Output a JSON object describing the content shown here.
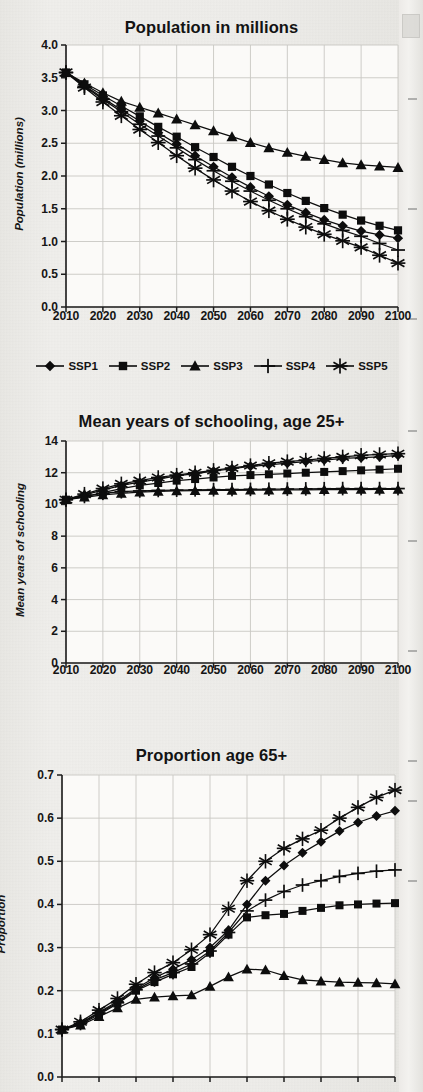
{
  "page": {
    "background": "#eeedea",
    "ink": "#111111"
  },
  "series_names": [
    "SSP1",
    "SSP2",
    "SSP3",
    "SSP4",
    "SSP5"
  ],
  "markers": {
    "SSP1": "diamond-marker",
    "SSP2": "square-marker",
    "SSP3": "triangle-marker",
    "SSP4": "plus-marker",
    "SSP5": "asterisk-marker"
  },
  "legend": {
    "position": "below-chart-1",
    "entries": [
      {
        "label": "SSP1",
        "marker": "diamond-marker"
      },
      {
        "label": "SSP2",
        "marker": "square-marker"
      },
      {
        "label": "SSP3",
        "marker": "triangle-marker"
      },
      {
        "label": "SSP4",
        "marker": "plus-marker"
      },
      {
        "label": "SSP5",
        "marker": "asterisk-marker"
      }
    ]
  },
  "chart_data": [
    {
      "type": "line",
      "title": "Population in millions",
      "xlabel": "",
      "ylabel": "Population (millions)",
      "x": [
        2010,
        2015,
        2020,
        2025,
        2030,
        2035,
        2040,
        2045,
        2050,
        2055,
        2060,
        2065,
        2070,
        2075,
        2080,
        2085,
        2090,
        2095,
        2100
      ],
      "tick_labels_x": [
        "2010",
        "2020",
        "2030",
        "2040",
        "2050",
        "2060",
        "2070",
        "2080",
        "2090",
        "2100"
      ],
      "tick_labels_y": [
        "0.0",
        "0.5",
        "1.0",
        "1.5",
        "2.0",
        "2.5",
        "3.0",
        "3.5",
        "4.0"
      ],
      "ylim": [
        0.0,
        4.0
      ],
      "xlim": [
        2010,
        2100
      ],
      "grid": true,
      "legend_position": "below",
      "series": [
        {
          "name": "SSP1",
          "marker": "diamond-marker",
          "values": [
            3.58,
            3.38,
            3.19,
            3.01,
            2.84,
            2.66,
            2.49,
            2.31,
            2.14,
            1.98,
            1.83,
            1.69,
            1.56,
            1.44,
            1.33,
            1.24,
            1.16,
            1.1,
            1.05
          ]
        },
        {
          "name": "SSP2",
          "marker": "square-marker",
          "values": [
            3.58,
            3.4,
            3.23,
            3.07,
            2.91,
            2.75,
            2.6,
            2.44,
            2.29,
            2.14,
            2.0,
            1.87,
            1.74,
            1.62,
            1.51,
            1.41,
            1.32,
            1.24,
            1.17
          ]
        },
        {
          "name": "SSP3",
          "marker": "triangle-marker",
          "values": [
            3.58,
            3.42,
            3.27,
            3.14,
            3.05,
            2.96,
            2.87,
            2.78,
            2.69,
            2.6,
            2.51,
            2.43,
            2.36,
            2.3,
            2.25,
            2.2,
            2.17,
            2.15,
            2.13
          ]
        },
        {
          "name": "SSP4",
          "marker": "plus-marker",
          "values": [
            3.58,
            3.37,
            3.17,
            2.98,
            2.79,
            2.61,
            2.43,
            2.25,
            2.08,
            1.92,
            1.77,
            1.63,
            1.5,
            1.38,
            1.27,
            1.17,
            1.08,
            0.97,
            0.87
          ]
        },
        {
          "name": "SSP5",
          "marker": "asterisk-marker",
          "values": [
            3.58,
            3.35,
            3.13,
            2.92,
            2.71,
            2.51,
            2.31,
            2.12,
            1.94,
            1.77,
            1.61,
            1.47,
            1.34,
            1.22,
            1.11,
            1.01,
            0.91,
            0.79,
            0.67
          ]
        }
      ]
    },
    {
      "type": "line",
      "title": "Mean years of schooling, age 25+",
      "xlabel": "",
      "ylabel": "Mean years of schooling",
      "x": [
        2010,
        2015,
        2020,
        2025,
        2030,
        2035,
        2040,
        2045,
        2050,
        2055,
        2060,
        2065,
        2070,
        2075,
        2080,
        2085,
        2090,
        2095,
        2100
      ],
      "tick_labels_x": [
        "2010",
        "2020",
        "2030",
        "2040",
        "2050",
        "2060",
        "2070",
        "2080",
        "2090",
        "2100"
      ],
      "tick_labels_y": [
        "0",
        "2",
        "4",
        "6",
        "8",
        "10",
        "12",
        "14"
      ],
      "ylim": [
        0,
        14
      ],
      "xlim": [
        2010,
        2100
      ],
      "grid": true,
      "legend_position": "none",
      "series": [
        {
          "name": "SSP1",
          "marker": "diamond-marker",
          "values": [
            10.3,
            10.6,
            10.9,
            11.2,
            11.4,
            11.6,
            11.8,
            11.95,
            12.1,
            12.25,
            12.4,
            12.5,
            12.6,
            12.7,
            12.8,
            12.9,
            12.95,
            13.0,
            13.1
          ]
        },
        {
          "name": "SSP2",
          "marker": "square-marker",
          "values": [
            10.3,
            10.5,
            10.75,
            11.0,
            11.2,
            11.35,
            11.5,
            11.6,
            11.7,
            11.8,
            11.85,
            11.9,
            11.95,
            12.0,
            12.05,
            12.1,
            12.15,
            12.2,
            12.25
          ]
        },
        {
          "name": "SSP3",
          "marker": "triangle-marker",
          "values": [
            10.3,
            10.45,
            10.6,
            10.7,
            10.78,
            10.82,
            10.85,
            10.87,
            10.88,
            10.89,
            10.9,
            10.9,
            10.91,
            10.92,
            10.93,
            10.94,
            10.94,
            10.95,
            10.95
          ]
        },
        {
          "name": "SSP4",
          "marker": "plus-marker",
          "values": [
            10.3,
            10.5,
            10.7,
            10.8,
            10.85,
            10.88,
            10.9,
            10.92,
            10.93,
            10.94,
            10.95,
            10.96,
            10.97,
            10.98,
            10.99,
            11.0,
            11.0,
            11.0,
            11.0
          ]
        },
        {
          "name": "SSP5",
          "marker": "asterisk-marker",
          "values": [
            10.3,
            10.65,
            11.0,
            11.3,
            11.5,
            11.7,
            11.85,
            12.0,
            12.15,
            12.3,
            12.45,
            12.6,
            12.7,
            12.8,
            12.9,
            13.0,
            13.1,
            13.15,
            13.2
          ]
        }
      ]
    },
    {
      "type": "line",
      "title": "Proportion age 65+",
      "xlabel": "",
      "ylabel": "Proportion",
      "x": [
        2010,
        2015,
        2020,
        2025,
        2030,
        2035,
        2040,
        2045,
        2050,
        2055,
        2060,
        2065,
        2070,
        2075,
        2080,
        2085,
        2090,
        2095,
        2100
      ],
      "tick_labels_x": [
        "2010",
        "2020",
        "2030",
        "2040",
        "2050",
        "2060",
        "2070",
        "2080",
        "2090",
        "2100"
      ],
      "tick_labels_y": [
        "0.0",
        "0.1",
        "0.2",
        "0.3",
        "0.4",
        "0.5",
        "0.6",
        "0.7"
      ],
      "ylim": [
        0.0,
        0.7
      ],
      "xlim": [
        2010,
        2100
      ],
      "grid": true,
      "legend_position": "none",
      "cropped_bottom": true,
      "series": [
        {
          "name": "SSP1",
          "marker": "diamond-marker",
          "values": [
            0.11,
            0.125,
            0.15,
            0.175,
            0.205,
            0.23,
            0.25,
            0.272,
            0.3,
            0.34,
            0.4,
            0.455,
            0.49,
            0.52,
            0.545,
            0.57,
            0.59,
            0.605,
            0.617
          ]
        },
        {
          "name": "SSP2",
          "marker": "square-marker",
          "values": [
            0.11,
            0.122,
            0.145,
            0.17,
            0.2,
            0.22,
            0.238,
            0.255,
            0.288,
            0.33,
            0.37,
            0.375,
            0.378,
            0.385,
            0.392,
            0.398,
            0.4,
            0.402,
            0.403
          ]
        },
        {
          "name": "SSP3",
          "marker": "triangle-marker",
          "values": [
            0.11,
            0.12,
            0.14,
            0.16,
            0.18,
            0.185,
            0.188,
            0.19,
            0.21,
            0.232,
            0.25,
            0.248,
            0.235,
            0.225,
            0.222,
            0.22,
            0.219,
            0.218,
            0.216
          ]
        },
        {
          "name": "SSP4",
          "marker": "plus-marker",
          "values": [
            0.11,
            0.124,
            0.148,
            0.172,
            0.202,
            0.225,
            0.242,
            0.262,
            0.292,
            0.335,
            0.385,
            0.41,
            0.43,
            0.445,
            0.455,
            0.465,
            0.472,
            0.477,
            0.48
          ]
        },
        {
          "name": "SSP5",
          "marker": "asterisk-marker",
          "values": [
            0.11,
            0.128,
            0.155,
            0.182,
            0.215,
            0.242,
            0.265,
            0.295,
            0.33,
            0.39,
            0.455,
            0.5,
            0.53,
            0.552,
            0.572,
            0.6,
            0.625,
            0.648,
            0.665
          ]
        }
      ]
    }
  ]
}
